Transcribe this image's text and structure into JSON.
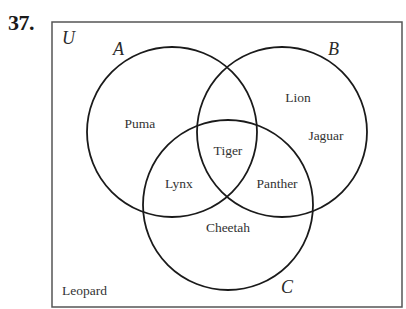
{
  "problem": {
    "number": "37."
  },
  "universe": {
    "label": "U",
    "rect": {
      "x": 52,
      "y": 22,
      "width": 350,
      "height": 285
    },
    "outside_elements": [
      {
        "name": "Leopard",
        "x": 62,
        "y": 295
      }
    ]
  },
  "sets": [
    {
      "label": "A",
      "cx": 172,
      "cy": 132,
      "r": 85,
      "label_x": 113,
      "label_y": 55
    },
    {
      "label": "B",
      "cx": 282,
      "cy": 132,
      "r": 85,
      "label_x": 328,
      "label_y": 55
    },
    {
      "label": "C",
      "cx": 228,
      "cy": 205,
      "r": 85,
      "label_x": 281,
      "label_y": 293
    }
  ],
  "regions": [
    {
      "region": "A only",
      "name": "Puma",
      "x": 140,
      "y": 128
    },
    {
      "region": "B only",
      "name": "Lion",
      "x": 298,
      "y": 102
    },
    {
      "region": "B only",
      "name": "Jaguar",
      "x": 326,
      "y": 140
    },
    {
      "region": "A∩B∩C",
      "name": "Tiger",
      "x": 228,
      "y": 155
    },
    {
      "region": "A∩C only",
      "name": "Lynx",
      "x": 179,
      "y": 188
    },
    {
      "region": "B∩C only",
      "name": "Panther",
      "x": 277,
      "y": 188
    },
    {
      "region": "C only",
      "name": "Cheetah",
      "x": 228,
      "y": 232
    }
  ],
  "colors": {
    "stroke": "#1a1a1a",
    "text": "#333333",
    "background": "#ffffff"
  }
}
